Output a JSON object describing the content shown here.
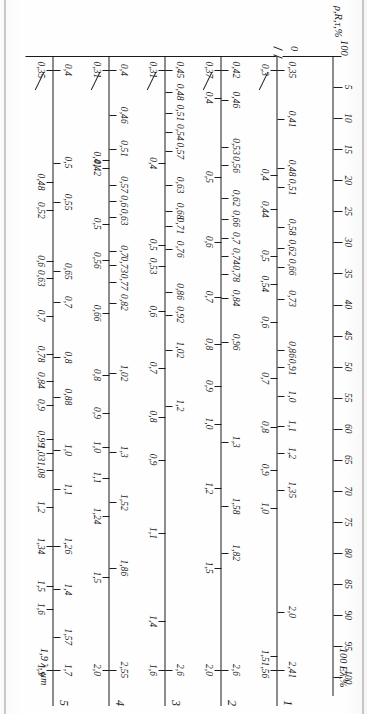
{
  "figure": {
    "kind": "nomogram",
    "left_title": "ρ,R,τ,%",
    "percent_axis_caption": "100 Eλ,%",
    "wavelength_axis_caption": "1,9 λ, μm",
    "zero_label": "0",
    "hundred_label": "100"
  },
  "chart_data": {
    "type": "table",
    "xlabel": "ρ,R,τ,%",
    "ylabel": "λ, μm",
    "grid": false,
    "legend": "none",
    "percent_axis": {
      "name": "percent",
      "caption": "100 Eλ,%",
      "end_label": "100 Eλ,%",
      "start_label": "100",
      "range": [
        0,
        100
      ],
      "ticks": [
        5,
        10,
        15,
        20,
        25,
        30,
        35,
        40,
        45,
        50,
        55,
        60,
        65,
        70,
        75,
        80,
        85,
        90,
        95,
        100
      ],
      "tick_labels": [
        "5",
        "10",
        "15",
        "20",
        "25",
        "30",
        "35",
        "40",
        "45",
        "50",
        "55",
        "60",
        "65",
        "70",
        "75",
        "80",
        "85",
        "90",
        "95",
        "100"
      ]
    },
    "scales": [
      {
        "index": "1",
        "upper": [
          "0,35",
          "0,41",
          "0,48",
          "0,51",
          "0,58",
          "0,62",
          "0,66",
          "0,73",
          "0,86",
          "0,91",
          "1,0",
          "1,1",
          "1,2",
          "1,35",
          "2,0",
          "2,41"
        ],
        "lower": [
          "0,3",
          "0,4",
          "0,44",
          "0,5",
          "0,54",
          "0,6",
          "0,7",
          "0,8",
          "0,9",
          "1,0",
          "1,5",
          "1,56"
        ]
      },
      {
        "index": "2",
        "upper": [
          "0,42",
          "0,46",
          "0,53",
          "0,56",
          "0,62",
          "0,66",
          "0,7",
          "0,74",
          "0,78",
          "0,84",
          "0,96",
          "1,3",
          "1,58",
          "1,82",
          "2,6"
        ],
        "lower": [
          "0,37",
          "0,4",
          "0,5",
          "0,6",
          "0,7",
          "0,8",
          "0,9",
          "1,0",
          "1,2",
          "1,5",
          "2,0"
        ]
      },
      {
        "index": "3",
        "upper": [
          "0,45",
          "0,48",
          "0,51",
          "0,54",
          "0,57",
          "0,63",
          "0,68",
          "0,71",
          "0,76",
          "0,86",
          "0,92",
          "1,02",
          "1,2",
          "2,6"
        ],
        "lower": [
          "0,31",
          "0,4",
          "0,5",
          "0,53",
          "0,6",
          "0,7",
          "0,8",
          "0,9",
          "1,1",
          "1,4",
          "1,6"
        ]
      },
      {
        "index": "4",
        "upper": [
          "0,4",
          "0,46",
          "0,51",
          "0,57",
          "0,6",
          "0,63",
          "0,7",
          "0,73",
          "0,77",
          "0,82",
          "1,02",
          "1,3",
          "1,52",
          "1,86",
          "2,55"
        ],
        "lower": [
          "0,31",
          "0,41",
          "0,42",
          "0,5",
          "0,56",
          "0,66",
          "0,8",
          "0,9",
          "1,0",
          "1,1",
          "1,24",
          "1,5",
          "2,0"
        ]
      },
      {
        "index": "5",
        "upper": [
          "0,4",
          "0,5",
          "0,55",
          "0,65",
          "0,7",
          "0,8",
          "0,88",
          "1,0",
          "1,1",
          "1,26",
          "1,4",
          "1,57",
          "1,7"
        ],
        "lower": [
          "0,35",
          "0,48",
          "0,52",
          "0,6",
          "0,63",
          "0,7",
          "0,78",
          "0,84",
          "0,9",
          "0,99",
          "1,03",
          "1,08",
          "1,2",
          "1,34",
          "1,5",
          "1,6",
          "1,9"
        ],
        "end_caption": "1,9 λ, μm"
      }
    ]
  },
  "axis_indices": [
    "1",
    "2",
    "3",
    "4",
    "5"
  ]
}
